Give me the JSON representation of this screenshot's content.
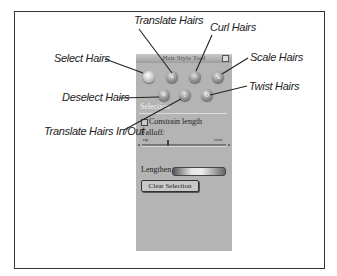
{
  "panel": {
    "title": "Hair Style Tool",
    "section_header": "Selection",
    "constrain_checkbox_label": "Constrain length",
    "falloff_label": "Falloff:",
    "falloff_min_label": "tip",
    "falloff_max_label": "root",
    "lengthen_label": "Lengthen",
    "clear_button_label": "Clear Selection",
    "tools_row1": [
      {
        "name": "select-hairs-tool",
        "glyph": ""
      },
      {
        "name": "translate-hairs-tool",
        "glyph": "•"
      },
      {
        "name": "curl-hairs-tool",
        "glyph": "~"
      },
      {
        "name": "scale-hairs-tool",
        "glyph": "↘"
      }
    ],
    "tools_row2": [
      {
        "name": "deselect-hairs-tool",
        "glyph": "×"
      },
      {
        "name": "translate-in-out-tool",
        "glyph": "↕"
      },
      {
        "name": "twist-hairs-tool",
        "glyph": "↻"
      }
    ]
  },
  "callouts": {
    "select": "Select Hairs",
    "translate": "Translate Hairs",
    "curl": "Curl Hairs",
    "scale": "Scale Hairs",
    "deselect": "Deselect Hairs",
    "twist": "Twist Hairs",
    "translate_in_out": "Translate Hairs In/Out"
  }
}
